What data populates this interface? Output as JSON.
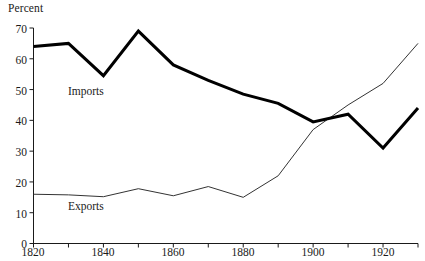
{
  "chart_data": {
    "type": "line",
    "title": "",
    "xlabel": "",
    "ylabel": "Percent",
    "ylim": [
      0,
      70
    ],
    "xlim": [
      1820,
      1930
    ],
    "grid": false,
    "legend_position": "inline-annotations",
    "y_ticks": [
      0,
      10,
      20,
      30,
      40,
      50,
      60,
      70
    ],
    "x_ticks": [
      1820,
      1840,
      1860,
      1880,
      1900,
      1920
    ],
    "x_minor_ticks": [
      1830,
      1850,
      1870,
      1890,
      1910,
      1930
    ],
    "x": [
      1820,
      1830,
      1840,
      1850,
      1860,
      1870,
      1880,
      1890,
      1900,
      1910,
      1920,
      1930
    ],
    "series": [
      {
        "name": "Imports",
        "color": "#000000",
        "line_width": 3,
        "values": [
          64,
          65,
          54.5,
          69,
          58,
          53,
          48.5,
          45.5,
          39.5,
          42,
          31,
          44
        ]
      },
      {
        "name": "Exports",
        "color": "#333333",
        "line_width": 1,
        "values": [
          16,
          15.8,
          15.2,
          17.8,
          15.5,
          18.5,
          15,
          22,
          37,
          45,
          52,
          65
        ]
      }
    ],
    "annotations": [
      {
        "text": "Imports",
        "x": 1837,
        "y": 50
      },
      {
        "text": "Exports",
        "x": 1837,
        "y": 11
      }
    ]
  },
  "labels": {
    "y_axis_title": "Percent",
    "y_70": "70",
    "y_60": "60",
    "y_50": "50",
    "y_40": "40",
    "y_30": "30",
    "y_20": "20",
    "y_10": "10",
    "y_0": "0",
    "x_1820": "1820",
    "x_1840": "1840",
    "x_1860": "1860",
    "x_1880": "1880",
    "x_1900": "1900",
    "x_1920": "1920",
    "series_imports": "Imports",
    "series_exports": "Exports"
  }
}
